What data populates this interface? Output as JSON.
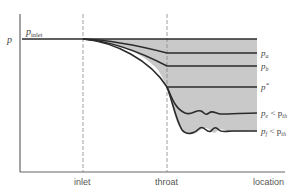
{
  "diagram": {
    "y_axis_label": "p",
    "inlet_pressure_label": "p",
    "inlet_pressure_sub": "inlet",
    "x_axis_label": "location",
    "markers": [
      {
        "label": "inlet"
      },
      {
        "label": "throat"
      }
    ],
    "curves": [
      {
        "label": "p",
        "sub": "a",
        "suffix": ""
      },
      {
        "label": "p",
        "sub": "b",
        "suffix": ""
      },
      {
        "label": "p",
        "sub": "",
        "suffix": "*"
      },
      {
        "label": "p",
        "sub": "e",
        "suffix": " < p",
        "suffix_sub": "th"
      },
      {
        "label": "p",
        "sub": "f",
        "suffix": " < p",
        "suffix_sub": "th"
      }
    ],
    "colors": {
      "line": "#2b2b2b",
      "shade": "#c9c9c9",
      "axis": "#666666",
      "dash": "#888888"
    }
  }
}
